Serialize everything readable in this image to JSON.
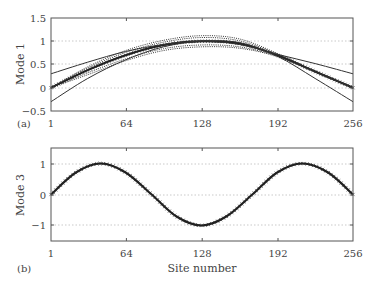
{
  "chart_data": [
    {
      "type": "line",
      "panel_label": "(a)",
      "title": "",
      "xlabel": "",
      "ylabel": "Mode 1",
      "xlim": [
        1,
        256
      ],
      "ylim": [
        -0.5,
        1.5
      ],
      "xticks": [
        1,
        64,
        128,
        192,
        256
      ],
      "yticks": [
        -0.5,
        0,
        0.5,
        1,
        1.5
      ],
      "ytick_labels": [
        "−0.5",
        "0",
        "0.5",
        "1",
        "1.5"
      ],
      "grid": "dotted horizontal at 0, 0.5, 1",
      "series": [
        {
          "name": "mode1-mean",
          "style": "solid thick",
          "x": [
            1,
            32,
            64,
            96,
            128,
            160,
            192,
            224,
            256
          ],
          "values": [
            0.0,
            0.38,
            0.7,
            0.92,
            1.0,
            0.95,
            0.7,
            0.35,
            0.0
          ]
        },
        {
          "name": "mode1-upper-bound",
          "style": "solid thin",
          "x": [
            1,
            32,
            64,
            96,
            128,
            160,
            192,
            224,
            256
          ],
          "values": [
            0.3,
            0.55,
            0.78,
            0.93,
            1.0,
            0.93,
            0.72,
            0.52,
            0.3
          ]
        },
        {
          "name": "mode1-lower-bound",
          "style": "solid thin",
          "x": [
            1,
            32,
            64,
            96,
            128,
            160,
            192,
            224,
            256
          ],
          "values": [
            -0.3,
            0.2,
            0.6,
            0.88,
            1.0,
            0.97,
            0.68,
            0.2,
            -0.3
          ]
        },
        {
          "name": "mode1-sample-1",
          "style": "dotted",
          "x": [
            1,
            32,
            64,
            96,
            128,
            160,
            192,
            224,
            256
          ],
          "values": [
            0.0,
            0.45,
            0.8,
            1.02,
            1.12,
            1.05,
            0.74,
            0.36,
            0.0
          ]
        },
        {
          "name": "mode1-sample-2",
          "style": "dotted",
          "x": [
            1,
            32,
            64,
            96,
            128,
            160,
            192,
            224,
            256
          ],
          "values": [
            0.0,
            0.42,
            0.76,
            0.98,
            1.08,
            1.01,
            0.72,
            0.35,
            0.0
          ]
        },
        {
          "name": "mode1-sample-3",
          "style": "dotted",
          "x": [
            1,
            32,
            64,
            96,
            128,
            160,
            192,
            224,
            256
          ],
          "values": [
            0.0,
            0.32,
            0.62,
            0.84,
            0.92,
            0.88,
            0.68,
            0.34,
            0.0
          ]
        },
        {
          "name": "mode1-sample-4",
          "style": "dotted",
          "x": [
            1,
            32,
            64,
            96,
            128,
            160,
            192,
            224,
            256
          ],
          "values": [
            0.0,
            0.28,
            0.58,
            0.8,
            0.88,
            0.85,
            0.67,
            0.33,
            0.0
          ]
        }
      ]
    },
    {
      "type": "line",
      "panel_label": "(b)",
      "title": "",
      "xlabel": "Site number",
      "ylabel": "Mode 3",
      "xlim": [
        1,
        256
      ],
      "ylim": [
        -1.5,
        1.5
      ],
      "xticks": [
        1,
        64,
        128,
        192,
        256
      ],
      "yticks": [
        -1,
        0,
        1
      ],
      "ytick_labels": [
        "−1",
        "0",
        "1"
      ],
      "grid": "dotted horizontal at -1, 0, 1",
      "series": [
        {
          "name": "mode3",
          "style": "solid with cross markers",
          "x": [
            1,
            22,
            43,
            64,
            86,
            107,
            128,
            149,
            171,
            192,
            213,
            235,
            256
          ],
          "values": [
            0.0,
            0.71,
            1.0,
            0.71,
            0.0,
            -0.71,
            -1.0,
            -0.71,
            0.0,
            0.71,
            1.0,
            0.71,
            0.0
          ]
        }
      ]
    }
  ],
  "labels": {
    "panel_a": "(a)",
    "panel_b": "(b)",
    "ylabel_a": "Mode 1",
    "ylabel_b": "Mode 3",
    "xlabel": "Site number",
    "xticks": [
      "1",
      "64",
      "128",
      "192",
      "256"
    ],
    "yticks_a": [
      "1.5",
      "1",
      "0.5",
      "0",
      "−0.5"
    ],
    "yticks_b": [
      "1",
      "0",
      "−1"
    ]
  }
}
